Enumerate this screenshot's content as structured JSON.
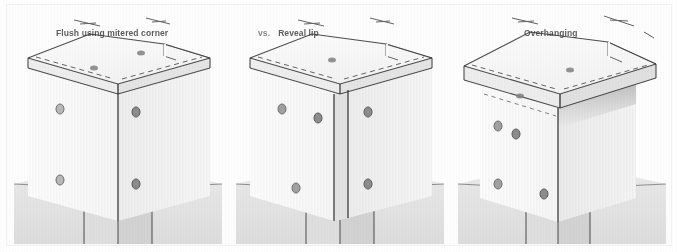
{
  "figure": {
    "panel_count": 3,
    "background_color": "#fdfdfd",
    "ink_color": "#3a3a3a"
  },
  "panels": [
    {
      "id": "flush-mitered-corner",
      "label_prefix": "",
      "label": "Flush using mitered corner",
      "description": "Cap slab flush with column faces, corner joined with a mitre",
      "fastener_count": 6
    },
    {
      "id": "reveal-lip",
      "label_prefix": "vs.",
      "label": "Reveal lip",
      "description": "Cap slab set back leaving a reveal at the column corner",
      "fastener_count": 6
    },
    {
      "id": "overhanging",
      "label_prefix": "",
      "label": "Overhanging",
      "description": "Cap slab projects past the column faces casting a shadow line",
      "fastener_count": 6
    }
  ],
  "colors": {
    "page": "#ffffff",
    "paper": "#fdfdfd",
    "top_face": "#f7f7f7",
    "left_face": "#fafafa",
    "right_face": "#f1f1f1",
    "edge_face": "#ececec",
    "ground": "#e0e0e0",
    "column": "#e6e6e6",
    "shadow": "#cfcfcf",
    "line": "#3a3a3a",
    "fastener": "#9a9a9a"
  }
}
